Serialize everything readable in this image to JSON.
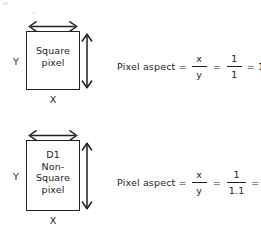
{
  "figure": {
    "ink_color": "#231f20",
    "background": "#ffffff"
  },
  "diagrams": [
    {
      "id": "square-pixel",
      "box_lines": [
        "Square",
        "pixel"
      ],
      "x_axis_label": "X",
      "y_axis_label": "Y",
      "x_arrow_icon": "double-headed-horizontal-arrow-icon",
      "y_arrow_icon": "double-headed-vertical-arrow-icon",
      "formula": {
        "lead_text": "Pixel aspect =",
        "symbolic": {
          "numerator": "x",
          "denominator": "y"
        },
        "equals_1": "=",
        "numeric": {
          "numerator": "1",
          "denominator": "1"
        },
        "result": "= 1.0"
      }
    },
    {
      "id": "d1-non-square-pixel",
      "box_lines": [
        "D1",
        "Non-",
        "Square",
        "pixel"
      ],
      "x_axis_label": "X",
      "y_axis_label": "Y",
      "x_arrow_icon": "double-headed-horizontal-arrow-icon",
      "y_arrow_icon": "double-headed-vertical-arrow-icon",
      "formula": {
        "lead_text": "Pixel aspect =",
        "symbolic": {
          "numerator": "x",
          "denominator": "y"
        },
        "equals_1": "=",
        "numeric": {
          "numerator": "1",
          "denominator": "1.1"
        },
        "result": "= 0.9"
      }
    }
  ]
}
